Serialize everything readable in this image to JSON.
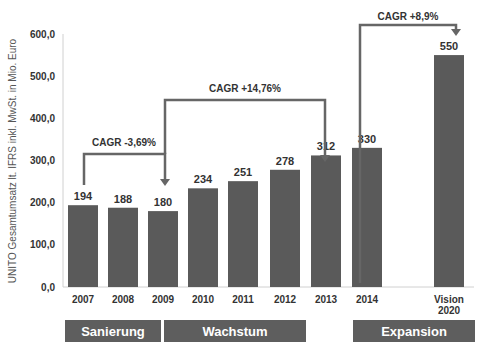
{
  "chart_data": {
    "type": "bar",
    "title": "",
    "ylabel": "UNITO Gesamtumsatz lt. IFRS inkl. MwSt. in Mio. Euro",
    "xlabel": "",
    "ylim": [
      0,
      600
    ],
    "yticks": [
      "0,0",
      "100,0",
      "200,0",
      "300,0",
      "400,0",
      "500,0",
      "600,0"
    ],
    "categories": [
      "2007",
      "2008",
      "2009",
      "2010",
      "2011",
      "2012",
      "2013",
      "2014",
      "Vision 2020"
    ],
    "values": [
      194,
      188,
      180,
      234,
      251,
      278,
      312,
      330,
      550
    ],
    "data_labels": [
      "194",
      "188",
      "180",
      "234",
      "251",
      "278",
      "312",
      "330",
      "550"
    ],
    "bar_color": "#5a5a5a",
    "grid": false,
    "annotations": [
      {
        "text": "CAGR -3,69%",
        "from": "2007",
        "to": "2009"
      },
      {
        "text": "CAGR +14,76%",
        "from": "2009",
        "to": "2013"
      },
      {
        "text": "CAGR +8,9%",
        "from": "2014",
        "to": "Vision 2020"
      }
    ],
    "phases": [
      {
        "label": "Sanierung",
        "span": [
          "2007",
          "2008"
        ]
      },
      {
        "label": "Wachstum",
        "span": [
          "2009",
          "2013"
        ]
      },
      {
        "label": "Expansion",
        "span": [
          "2014",
          "Vision 2020"
        ]
      }
    ]
  }
}
